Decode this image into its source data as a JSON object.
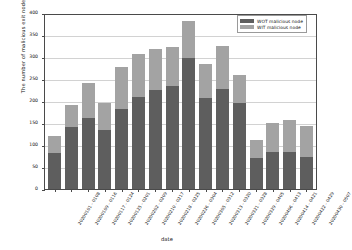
{
  "chart_data": {
    "type": "bar",
    "stacked": true,
    "title": "",
    "xlabel": "date",
    "ylabel": "The number of malicious exit nodes",
    "ylim": [
      0,
      400
    ],
    "yticks": [
      0,
      50,
      100,
      150,
      200,
      250,
      300,
      350,
      400
    ],
    "grid": true,
    "legend_position": "top-right",
    "categories": [
      "20200101 - 0108",
      "20200109 - 0116",
      "20200117 - 0124",
      "20200125 - 0201",
      "20200202 - 0209",
      "20200210 - 0217",
      "20200218 - 0225",
      "20200226 - 0304",
      "20200305 - 0312",
      "20200313 - 0320",
      "20200321 - 0328",
      "20200329 - 0405",
      "20200406 - 0413",
      "20200414 - 0421",
      "20200422 - 0429",
      "20200430 - 0507"
    ],
    "series": [
      {
        "name": "WOT malicious node",
        "color": "#5e5e5e",
        "values": [
          81,
          141,
          162,
          133,
          182,
          209,
          225,
          234,
          298,
          207,
          228,
          196,
          70,
          84,
          84,
          72
        ]
      },
      {
        "name": "WIT malicious node",
        "color": "#a3a3a3",
        "values": [
          40,
          49,
          79,
          62,
          96,
          97,
          93,
          88,
          85,
          78,
          97,
          63,
          42,
          67,
          74,
          71
        ]
      }
    ],
    "totals": [
      121,
      190,
      241,
      195,
      278,
      306,
      318,
      322,
      383,
      285,
      325,
      259,
      112,
      151,
      158,
      143
    ]
  },
  "legend": {
    "entries": [
      {
        "label": "WOT malicious node",
        "color": "#5e5e5e"
      },
      {
        "label": "WIT malicious node",
        "color": "#a3a3a3"
      }
    ]
  }
}
